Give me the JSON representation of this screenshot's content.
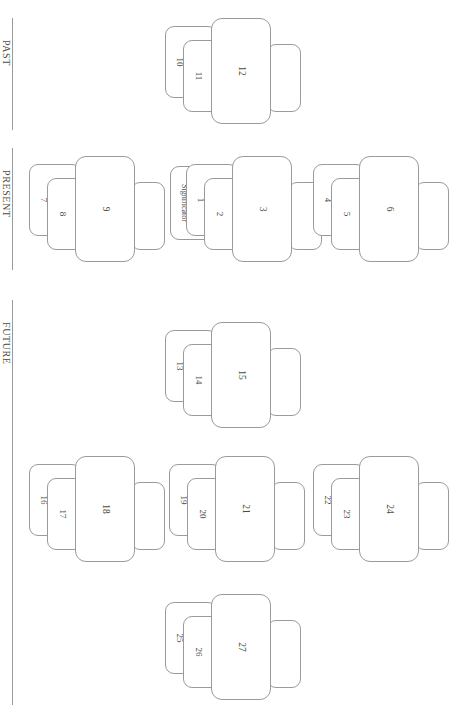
{
  "page": {
    "orientation": "rotated-90",
    "line_color": "#9a9a9a",
    "text_color": "#4a4a4a",
    "background": "#ffffff"
  },
  "sections": [
    {
      "id": "past",
      "label": "PAST",
      "divider_top": 18,
      "divider_height": 112
    },
    {
      "id": "present",
      "label": "PRESENT",
      "divider_top": 148,
      "divider_height": 122
    },
    {
      "id": "future",
      "label": "FUTURE",
      "divider_top": 300,
      "divider_height": 405
    }
  ],
  "groups": [
    {
      "id": "group-past-center",
      "section": "past",
      "x": 163,
      "y": 14,
      "cards": [
        {
          "slot": "peek",
          "label": ""
        },
        {
          "slot": "small-a",
          "label": "10"
        },
        {
          "slot": "small-b",
          "label": "11"
        },
        {
          "slot": "big",
          "label": "12"
        }
      ]
    },
    {
      "id": "group-present-left",
      "section": "present",
      "x": 27,
      "y": 152,
      "cards": [
        {
          "slot": "peek",
          "label": ""
        },
        {
          "slot": "small-a",
          "label": "7"
        },
        {
          "slot": "small-b",
          "label": "8"
        },
        {
          "slot": "big",
          "label": "9"
        }
      ]
    },
    {
      "id": "group-present-center",
      "section": "present",
      "x": 184,
      "y": 152,
      "cards": [
        {
          "slot": "peek",
          "label": ""
        },
        {
          "slot": "sig",
          "label": "Significator"
        },
        {
          "slot": "small-a",
          "label": "1"
        },
        {
          "slot": "small-b",
          "label": "2"
        },
        {
          "slot": "big",
          "label": "3"
        }
      ]
    },
    {
      "id": "group-present-right",
      "section": "present",
      "x": 311,
      "y": 152,
      "cards": [
        {
          "slot": "peek",
          "label": ""
        },
        {
          "slot": "small-a",
          "label": "4"
        },
        {
          "slot": "small-b",
          "label": "5"
        },
        {
          "slot": "big",
          "label": "6"
        }
      ]
    },
    {
      "id": "group-future-top",
      "section": "future",
      "x": 163,
      "y": 318,
      "cards": [
        {
          "slot": "peek",
          "label": ""
        },
        {
          "slot": "small-a",
          "label": "13"
        },
        {
          "slot": "small-b",
          "label": "14"
        },
        {
          "slot": "big",
          "label": "15"
        }
      ]
    },
    {
      "id": "group-future-left",
      "section": "future",
      "x": 27,
      "y": 452,
      "cards": [
        {
          "slot": "peek",
          "label": ""
        },
        {
          "slot": "small-a",
          "label": "16"
        },
        {
          "slot": "small-b",
          "label": "17"
        },
        {
          "slot": "big",
          "label": "18"
        }
      ]
    },
    {
      "id": "group-future-center",
      "section": "future",
      "x": 167,
      "y": 452,
      "cards": [
        {
          "slot": "peek",
          "label": ""
        },
        {
          "slot": "small-a",
          "label": "19"
        },
        {
          "slot": "small-b",
          "label": "20"
        },
        {
          "slot": "big",
          "label": "21"
        }
      ]
    },
    {
      "id": "group-future-right",
      "section": "future",
      "x": 311,
      "y": 452,
      "cards": [
        {
          "slot": "peek",
          "label": ""
        },
        {
          "slot": "small-a",
          "label": "22"
        },
        {
          "slot": "small-b",
          "label": "23"
        },
        {
          "slot": "big",
          "label": "24"
        }
      ]
    },
    {
      "id": "group-future-bottom",
      "section": "future",
      "x": 163,
      "y": 590,
      "cards": [
        {
          "slot": "peek",
          "label": ""
        },
        {
          "slot": "small-a",
          "label": "25"
        },
        {
          "slot": "small-b",
          "label": "26"
        },
        {
          "slot": "big",
          "label": "27"
        }
      ]
    }
  ]
}
